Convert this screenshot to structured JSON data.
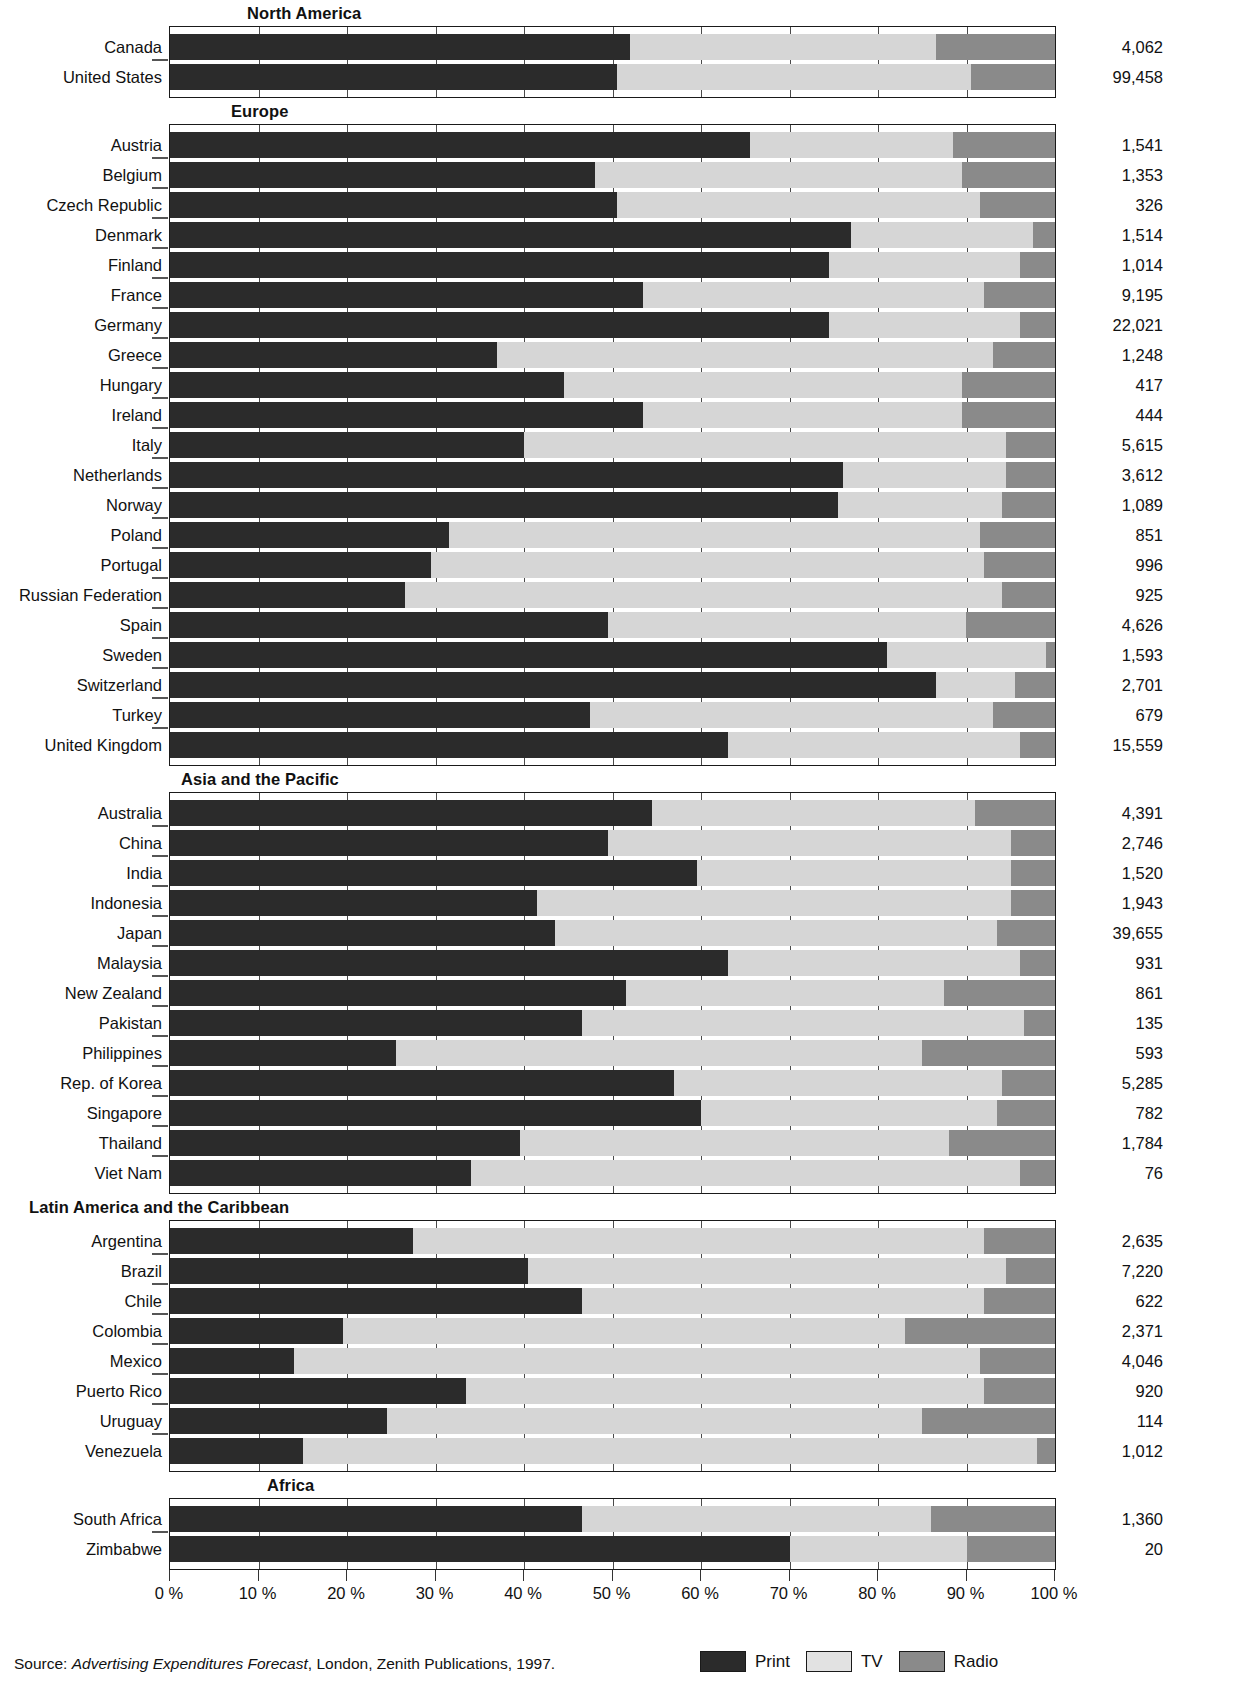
{
  "chart_data": {
    "type": "bar",
    "subtype": "stacked-horizontal-100pct",
    "title": "",
    "xlabel": "",
    "ylabel": "",
    "xlim": [
      0,
      100
    ],
    "grid": true,
    "legend_position": "bottom-right",
    "x_ticks": [
      "0 %",
      "10 %",
      "20 %",
      "30 %",
      "40 %",
      "50 %",
      "60 %",
      "70 %",
      "80 %",
      "90 %",
      "100 %"
    ],
    "x_tick_values": [
      0,
      10,
      20,
      30,
      40,
      50,
      60,
      70,
      80,
      90,
      100
    ],
    "series": [
      {
        "name": "Print",
        "color": "#2b2b2b"
      },
      {
        "name": "TV",
        "color": "#d6d6d6"
      },
      {
        "name": "Radio",
        "color": "#8a8a8a"
      }
    ],
    "value_column_header": "",
    "groups": [
      {
        "name": "North America",
        "rows": [
          {
            "label": "Canada",
            "print": 52.0,
            "tv": 34.5,
            "radio": 13.5,
            "value": "4,062"
          },
          {
            "label": "United States",
            "print": 50.5,
            "tv": 40.0,
            "radio": 9.5,
            "value": "99,458"
          }
        ]
      },
      {
        "name": "Europe",
        "rows": [
          {
            "label": "Austria",
            "print": 65.5,
            "tv": 23.0,
            "radio": 11.5,
            "value": "1,541"
          },
          {
            "label": "Belgium",
            "print": 48.0,
            "tv": 41.5,
            "radio": 10.5,
            "value": "1,353"
          },
          {
            "label": "Czech Republic",
            "print": 50.5,
            "tv": 41.0,
            "radio": 8.5,
            "value": "326"
          },
          {
            "label": "Denmark",
            "print": 77.0,
            "tv": 20.5,
            "radio": 2.5,
            "value": "1,514"
          },
          {
            "label": "Finland",
            "print": 74.5,
            "tv": 21.5,
            "radio": 4.0,
            "value": "1,014"
          },
          {
            "label": "France",
            "print": 53.5,
            "tv": 38.5,
            "radio": 8.0,
            "value": "9,195"
          },
          {
            "label": "Germany",
            "print": 74.5,
            "tv": 21.5,
            "radio": 4.0,
            "value": "22,021"
          },
          {
            "label": "Greece",
            "print": 37.0,
            "tv": 56.0,
            "radio": 7.0,
            "value": "1,248"
          },
          {
            "label": "Hungary",
            "print": 44.5,
            "tv": 45.0,
            "radio": 10.5,
            "value": "417"
          },
          {
            "label": "Ireland",
            "print": 53.5,
            "tv": 36.0,
            "radio": 10.5,
            "value": "444"
          },
          {
            "label": "Italy",
            "print": 40.0,
            "tv": 54.5,
            "radio": 5.5,
            "value": "5,615"
          },
          {
            "label": "Netherlands",
            "print": 76.0,
            "tv": 18.5,
            "radio": 5.5,
            "value": "3,612"
          },
          {
            "label": "Norway",
            "print": 75.5,
            "tv": 18.5,
            "radio": 6.0,
            "value": "1,089"
          },
          {
            "label": "Poland",
            "print": 31.5,
            "tv": 60.0,
            "radio": 8.5,
            "value": "851"
          },
          {
            "label": "Portugal",
            "print": 29.5,
            "tv": 62.5,
            "radio": 8.0,
            "value": "996"
          },
          {
            "label": "Russian Federation",
            "print": 26.5,
            "tv": 67.5,
            "radio": 6.0,
            "value": "925"
          },
          {
            "label": "Spain",
            "print": 49.5,
            "tv": 40.5,
            "radio": 10.0,
            "value": "4,626"
          },
          {
            "label": "Sweden",
            "print": 81.0,
            "tv": 18.0,
            "radio": 1.0,
            "value": "1,593"
          },
          {
            "label": "Switzerland",
            "print": 86.5,
            "tv": 9.0,
            "radio": 4.5,
            "value": "2,701"
          },
          {
            "label": "Turkey",
            "print": 47.5,
            "tv": 45.5,
            "radio": 7.0,
            "value": "679"
          },
          {
            "label": "United Kingdom",
            "print": 63.0,
            "tv": 33.0,
            "radio": 4.0,
            "value": "15,559"
          }
        ]
      },
      {
        "name": "Asia  and the Pacific",
        "rows": [
          {
            "label": "Australia",
            "print": 54.5,
            "tv": 36.5,
            "radio": 9.0,
            "value": "4,391"
          },
          {
            "label": "China",
            "print": 49.5,
            "tv": 45.5,
            "radio": 5.0,
            "value": "2,746"
          },
          {
            "label": "India",
            "print": 59.5,
            "tv": 35.5,
            "radio": 5.0,
            "value": "1,520"
          },
          {
            "label": "Indonesia",
            "print": 41.5,
            "tv": 53.5,
            "radio": 5.0,
            "value": "1,943"
          },
          {
            "label": "Japan",
            "print": 43.5,
            "tv": 50.0,
            "radio": 6.5,
            "value": "39,655"
          },
          {
            "label": "Malaysia",
            "print": 63.0,
            "tv": 33.0,
            "radio": 4.0,
            "value": "931"
          },
          {
            "label": "New Zealand",
            "print": 51.5,
            "tv": 36.0,
            "radio": 12.5,
            "value": "861"
          },
          {
            "label": "Pakistan",
            "print": 46.5,
            "tv": 50.0,
            "radio": 3.5,
            "value": "135"
          },
          {
            "label": "Philippines",
            "print": 25.5,
            "tv": 59.5,
            "radio": 15.0,
            "value": "593"
          },
          {
            "label": "Rep. of Korea",
            "print": 57.0,
            "tv": 37.0,
            "radio": 6.0,
            "value": "5,285"
          },
          {
            "label": "Singapore",
            "print": 60.0,
            "tv": 33.5,
            "radio": 6.5,
            "value": "782"
          },
          {
            "label": "Thailand",
            "print": 39.5,
            "tv": 48.5,
            "radio": 12.0,
            "value": "1,784"
          },
          {
            "label": "Viet Nam",
            "print": 34.0,
            "tv": 62.0,
            "radio": 4.0,
            "value": "76"
          }
        ]
      },
      {
        "name": "Latin America and the Caribbean",
        "rows": [
          {
            "label": "Argentina",
            "print": 27.5,
            "tv": 64.5,
            "radio": 8.0,
            "value": "2,635"
          },
          {
            "label": "Brazil",
            "print": 40.5,
            "tv": 54.0,
            "radio": 5.5,
            "value": "7,220"
          },
          {
            "label": "Chile",
            "print": 46.5,
            "tv": 45.5,
            "radio": 8.0,
            "value": "622"
          },
          {
            "label": "Colombia",
            "print": 19.5,
            "tv": 63.5,
            "radio": 17.0,
            "value": "2,371"
          },
          {
            "label": "Mexico",
            "print": 14.0,
            "tv": 77.5,
            "radio": 8.5,
            "value": "4,046"
          },
          {
            "label": "Puerto Rico",
            "print": 33.5,
            "tv": 58.5,
            "radio": 8.0,
            "value": "920"
          },
          {
            "label": "Uruguay",
            "print": 24.5,
            "tv": 60.5,
            "radio": 15.0,
            "value": "114"
          },
          {
            "label": "Venezuela",
            "print": 15.0,
            "tv": 83.0,
            "radio": 2.0,
            "value": "1,012"
          }
        ]
      },
      {
        "name": "Africa",
        "rows": [
          {
            "label": "South Africa",
            "print": 46.5,
            "tv": 39.5,
            "radio": 14.0,
            "value": "1,360"
          },
          {
            "label": "Zimbabwe",
            "print": 70.0,
            "tv": 20.0,
            "radio": 10.0,
            "value": "20"
          }
        ]
      }
    ]
  },
  "legend": {
    "items": [
      {
        "label": "Print",
        "color": "#2b2b2b"
      },
      {
        "label": "TV",
        "color": "#e2e2e2"
      },
      {
        "label": "Radio",
        "color": "#8a8a8a"
      }
    ]
  },
  "source": {
    "prefix": "Source:",
    "italic": "Advertising Expenditures Forecast",
    "rest": ", London, Zenith Publications, 1997."
  }
}
